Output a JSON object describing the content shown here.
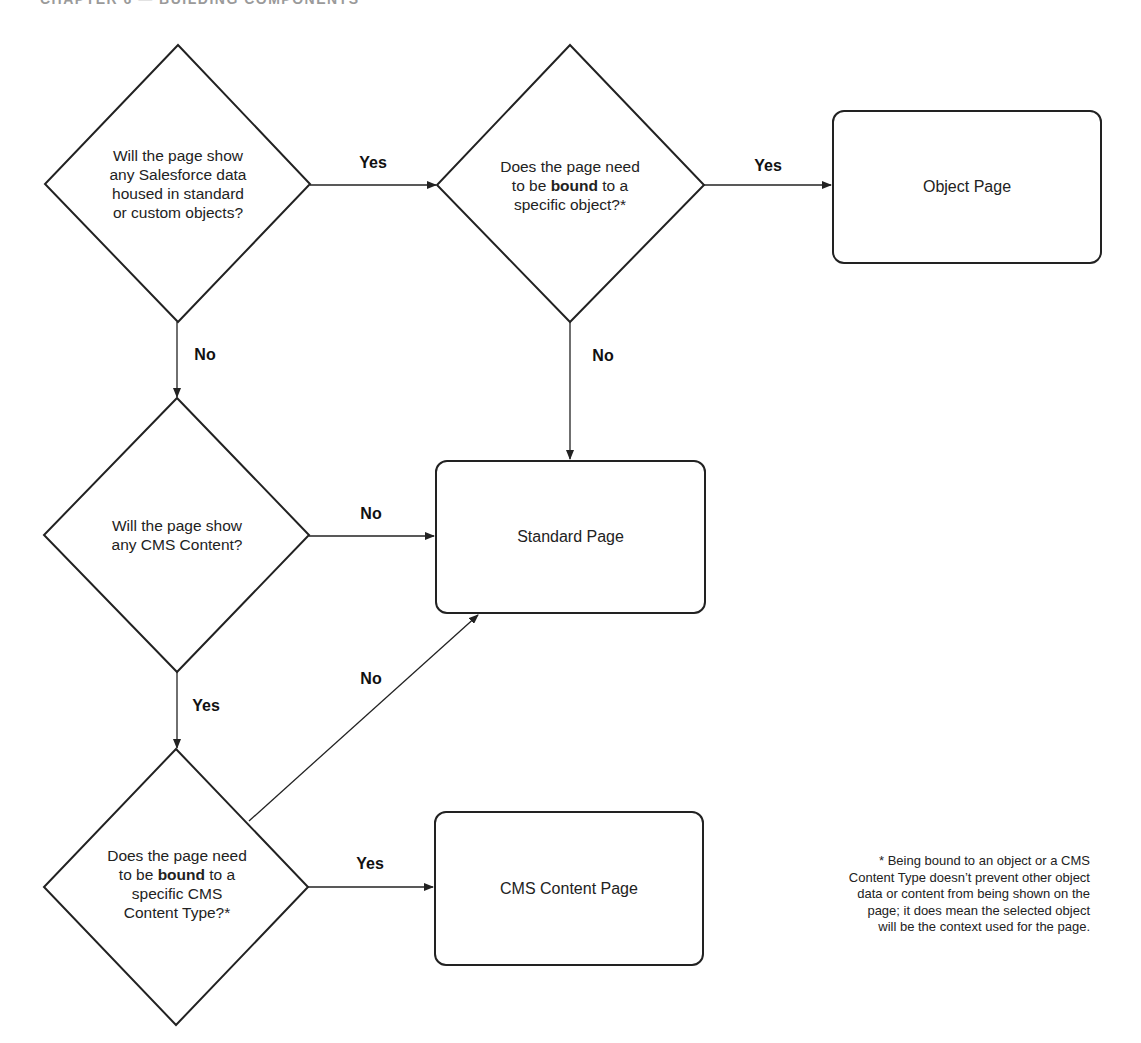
{
  "header": {
    "text": "CHAPTER 6 — BUILDING COMPONENTS"
  },
  "decisions": [
    {
      "id": "d1",
      "lines": [
        "Will the page show",
        "any Salesforce data",
        "housed in standard",
        "or custom objects?"
      ]
    },
    {
      "id": "d2",
      "line1": "Does the page need",
      "line2_pre": "to be ",
      "line2_bold": "bound",
      "line2_post": " to a",
      "line3": "specific object?*"
    },
    {
      "id": "d3",
      "lines": [
        "Will the page show",
        "any CMS Content?"
      ]
    },
    {
      "id": "d4",
      "line1": "Does the page need",
      "line2_pre": "to be ",
      "line2_bold": "bound",
      "line2_post": " to a",
      "line3": "specific CMS",
      "line4": "Content Type?*"
    }
  ],
  "outcomes": {
    "object_page": "Object Page",
    "standard_page": "Standard Page",
    "cms_content_page": "CMS Content Page"
  },
  "edges": {
    "d1_to_d2": "Yes",
    "d2_to_object": "Yes",
    "d1_to_d3": "No",
    "d2_to_standard": "No",
    "d3_to_standard": "No",
    "d3_to_d4": "Yes",
    "d4_to_standard": "No",
    "d4_to_cms": "Yes"
  },
  "footnote": {
    "lines": [
      "* Being bound to an object or a CMS",
      "Content Type doesn’t prevent other object",
      "data or content from being shown on the",
      "page; it does mean the selected object",
      "will be the context used for the page."
    ]
  },
  "colors": {
    "stroke": "#222222",
    "text": "#222222",
    "background": "#ffffff"
  }
}
